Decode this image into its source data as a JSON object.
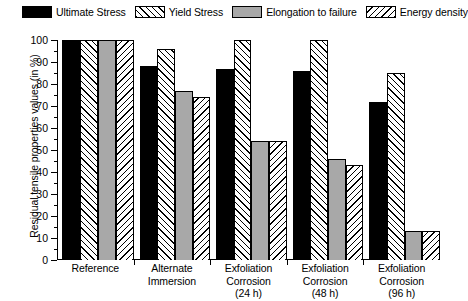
{
  "chart_data": {
    "type": "bar",
    "title": "",
    "xlabel": "",
    "ylabel": "Residual tensile properties values (in %)",
    "ylim": [
      0,
      100
    ],
    "ytick_step": 10,
    "ytick_labels": [
      "100",
      "90",
      "80",
      "70",
      "60",
      "50",
      "40",
      "30",
      "20",
      "10",
      "0"
    ],
    "grid": false,
    "legend_position": "top",
    "categories": [
      [
        "Reference"
      ],
      [
        "Alternate",
        "Immersion"
      ],
      [
        "Exfoliation",
        "Corrosion",
        "(24 h)"
      ],
      [
        "Exfoliation",
        "Corrosion",
        "(48 h)"
      ],
      [
        "Exfoliation",
        "Corrosion",
        "(96 h)"
      ]
    ],
    "series": [
      {
        "name": "Ultimate Stress",
        "fill": "solid-black",
        "color": "#000000",
        "values": [
          100,
          88,
          87,
          86,
          72
        ]
      },
      {
        "name": "Yield Stress",
        "fill": "hatch-right",
        "color": "#ffffff",
        "values": [
          100,
          96,
          100,
          100,
          85
        ]
      },
      {
        "name": "Elongation to failure",
        "fill": "gray",
        "color": "#a8a8a8",
        "values": [
          100,
          77,
          54,
          46,
          13
        ]
      },
      {
        "name": "Energy density",
        "fill": "hatch-left",
        "color": "#ffffff",
        "values": [
          100,
          74,
          54,
          43,
          13
        ]
      }
    ]
  }
}
